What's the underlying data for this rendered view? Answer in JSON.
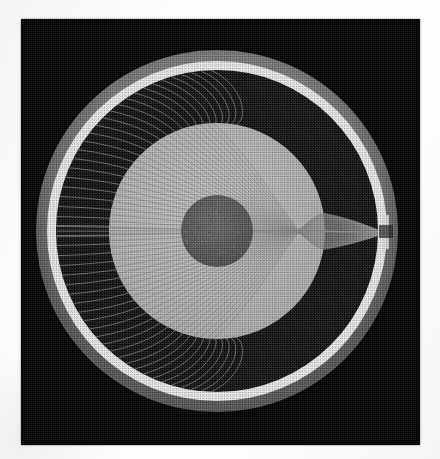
{
  "figure": {
    "title": "Ray-trace cross-section of concentric refractive zones",
    "plate": {
      "x": 21,
      "y": 19,
      "width": 399,
      "height": 426,
      "background_color": "#050505"
    },
    "page_background_color": "#fdfdfd"
  },
  "chart_data": {
    "type": "scatter",
    "title": "Ray-trace cross-section of concentric refractive zones",
    "subtitle": "",
    "xlabel": "",
    "ylabel": "",
    "xlim": [
      0,
      399
    ],
    "ylim": [
      0,
      426
    ],
    "grid": false,
    "legend_position": "none",
    "tick_labels": [],
    "annotations": [],
    "center": {
      "x": 196,
      "y": 212
    },
    "focus_point": {
      "x": 364,
      "y": 214,
      "label": ""
    },
    "zones": [
      {
        "name": "outer-rim",
        "kind": "annulus",
        "outer_radius": 181,
        "inner_radius": 170,
        "fill": "#6d6d6d",
        "description": "medium grey outer rim band"
      },
      {
        "name": "bright-ring",
        "kind": "annulus",
        "outer_radius": 170,
        "inner_radius": 161,
        "fill": "#e8e8e8",
        "description": "bright white annular ring"
      },
      {
        "name": "dark-annulus",
        "kind": "annulus",
        "outer_radius": 161,
        "inner_radius": 108,
        "fill": "#151515",
        "description": "dark outer medium region"
      },
      {
        "name": "light-disc",
        "kind": "disc",
        "outer_radius": 108,
        "inner_radius": 36,
        "fill": "#b4b4b4",
        "description": "light grey inner medium"
      },
      {
        "name": "dark-core",
        "kind": "disc",
        "outer_radius": 36,
        "inner_radius": 0,
        "fill": "#5a5a5a",
        "description": "dark grey central core"
      }
    ],
    "series": [
      {
        "name": "upper-ray-fan",
        "count": 26,
        "entry_angle_range_deg": [
          92,
          182
        ],
        "color": "#8c8c8c"
      },
      {
        "name": "lower-ray-fan",
        "count": 26,
        "entry_angle_range_deg": [
          178,
          268
        ],
        "color": "#8c8c8c"
      },
      {
        "name": "axial-ray",
        "count": 1,
        "entry_angle_range_deg": [
          180,
          180
        ],
        "color": "#9a9a9a"
      }
    ],
    "halftone": {
      "enabled": true,
      "pattern": "ordered-dither",
      "cell_px": 2
    }
  }
}
